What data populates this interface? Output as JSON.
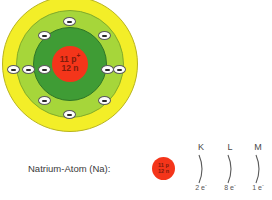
{
  "diagram": {
    "title": "Natrium-Atom (Na)",
    "caption_label": "Natrium-Atom (Na):",
    "colors": {
      "nucleus": "#f4351a",
      "nucleus_text": "#7d1b0c",
      "shell_k": "#3f9c35",
      "shell_l": "#a6d63a",
      "shell_m": "#f3ee28",
      "electron_fill": "#fdfdfd",
      "electron_stroke": "#5a5a5a",
      "background": "#ffffff"
    },
    "nucleus": {
      "protons_line": "11 p",
      "protons_charge": "+",
      "neutrons_line": "12 n"
    },
    "mini_nucleus": {
      "protons_line": "11 p",
      "neutrons_line": "12 n"
    },
    "electrons": [
      {
        "shell": "K",
        "label": "electron",
        "symbol": "-"
      },
      {
        "shell": "K",
        "label": "electron",
        "symbol": "-"
      },
      {
        "shell": "L",
        "label": "electron",
        "symbol": "-"
      },
      {
        "shell": "L",
        "label": "electron",
        "symbol": "-"
      },
      {
        "shell": "L",
        "label": "electron",
        "symbol": "-"
      },
      {
        "shell": "L",
        "label": "electron",
        "symbol": "-"
      },
      {
        "shell": "L",
        "label": "electron",
        "symbol": "-"
      },
      {
        "shell": "L",
        "label": "electron",
        "symbol": "-"
      },
      {
        "shell": "L",
        "label": "electron",
        "symbol": "-"
      },
      {
        "shell": "L",
        "label": "electron",
        "symbol": "-"
      },
      {
        "shell": "M",
        "label": "electron",
        "symbol": "-"
      }
    ],
    "shell_legend": [
      {
        "letter": "K",
        "count": "2 e",
        "charge": "-"
      },
      {
        "letter": "L",
        "count": "8 e",
        "charge": "-"
      },
      {
        "letter": "M",
        "count": "1 e",
        "charge": "-"
      }
    ]
  }
}
